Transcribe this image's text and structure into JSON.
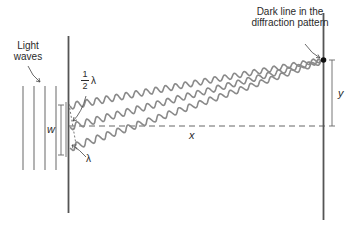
{
  "diagram": {
    "type": "single-slit diffraction",
    "labels": {
      "light_waves_line1": "Light",
      "light_waves_line2": "waves",
      "dark_line_line1": "Dark line in the",
      "dark_line_line2": "diffraction pattern",
      "half_lambda_num": "1",
      "half_lambda_den": "2",
      "half_lambda_sym": "λ",
      "lambda": "λ",
      "slit_width": "w",
      "distance": "x",
      "displacement": "y"
    },
    "colors": {
      "wave": "#8a8a8a",
      "line": "#555555",
      "text": "#2a2a2a",
      "dot": "#111111"
    }
  }
}
